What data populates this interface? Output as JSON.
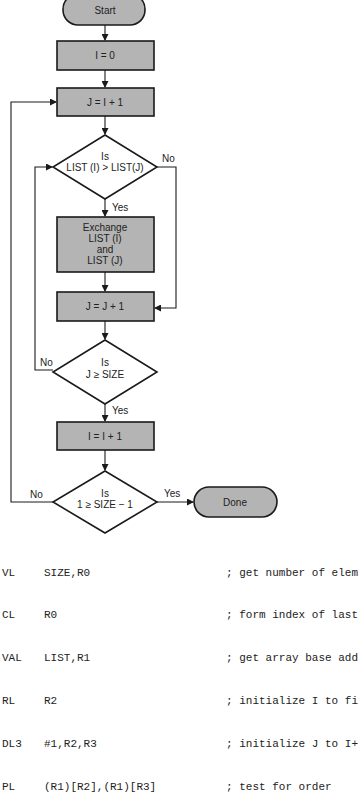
{
  "flowchart": {
    "start": "Start",
    "init_i": "I = 0",
    "init_j": "J = I + 1",
    "decision1": {
      "line1": "Is",
      "line2": "LIST (I) > LIST(J)",
      "yes": "Yes",
      "no": "No"
    },
    "exchange": [
      "Exchange",
      "LIST (I)",
      "and",
      "LIST (J)"
    ],
    "inc_j": "J = J + 1",
    "decision2": {
      "line1": "Is",
      "line2": "J ≥ SIZE",
      "yes": "Yes",
      "no": "No"
    },
    "inc_i": "I = I + 1",
    "decision3": {
      "line1": "Is",
      "line2": "1 ≥ SIZE  − 1",
      "yes": "Yes",
      "no": "No"
    },
    "done": "Done"
  },
  "code": [
    {
      "op": "VL",
      "args": "SIZE,R0",
      "comment": "; get number of elem"
    },
    {
      "op": "CL",
      "args": "R0",
      "comment": "; form index of last"
    },
    {
      "op": "VAL",
      "args": "LIST,R1",
      "comment": "; get array base add"
    },
    {
      "op": "RL",
      "args": "R2",
      "comment": "; initialize I to fi"
    },
    {
      "op": "DL3",
      "args": "#1,R2,R3",
      "comment": "; initialize J to I+"
    },
    {
      "op": "PL",
      "args": "(R1)[R2],(R1)[R3]",
      "comment": "; test for order"
    }
  ],
  "colors": {
    "box_fill": "#b4b4b4",
    "stroke": "#1a1a1a",
    "background": "#ffffff"
  }
}
